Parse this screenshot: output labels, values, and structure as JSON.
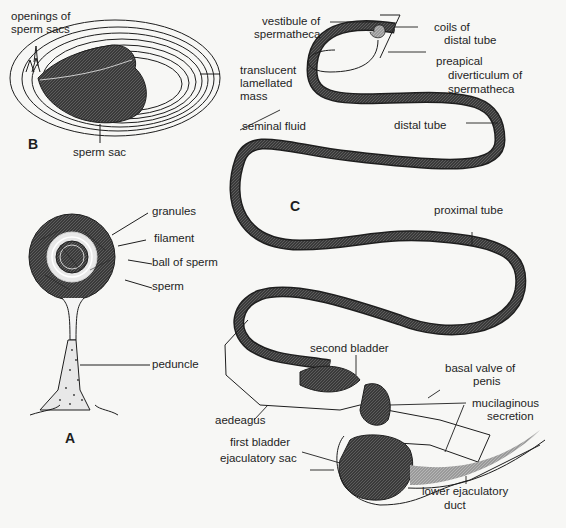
{
  "figure": {
    "panels": {
      "A": {
        "letter": "A",
        "labels": {
          "granules": "granules",
          "filament": "filament",
          "ball_of_sperm": "ball of sperm",
          "sperm": "sperm",
          "peduncle": "peduncle"
        }
      },
      "B": {
        "letter": "B",
        "labels": {
          "openings_1": "openings of",
          "openings_2": "sperm sacs",
          "translucent_1": "translucent",
          "translucent_2": "lamellated",
          "translucent_3": "mass",
          "sperm_sac": "sperm sac"
        }
      },
      "C": {
        "letter": "C",
        "labels": {
          "vestibule_1": "vestibule of",
          "vestibule_2": "spermatheca",
          "coils_1": "coils of",
          "coils_2": "distal tube",
          "preapical_1": "preapical",
          "preapical_2": "diverticulum of",
          "preapical_3": "spermatheca",
          "seminal_fluid": "seminal fluid",
          "distal_tube": "distal tube",
          "proximal_tube": "proximal tube",
          "second_bladder": "second bladder",
          "basal_valve_1": "basal valve of",
          "basal_valve_2": "penis",
          "mucilaginous_1": "mucilaginous",
          "mucilaginous_2": "secretion",
          "aedeagus": "aedeagus",
          "first_bladder": "first bladder",
          "ejaculatory_sac": "ejaculatory sac",
          "lower_duct_1": "lower ejaculatory",
          "lower_duct_2": "duct"
        }
      }
    },
    "colors": {
      "background": "#f7f7f5",
      "ink": "#1e1e1e",
      "dark_fill": "#3a3a3a",
      "tube_fill": "#6a6a6a",
      "light_fill": "#a8a8a8"
    }
  }
}
